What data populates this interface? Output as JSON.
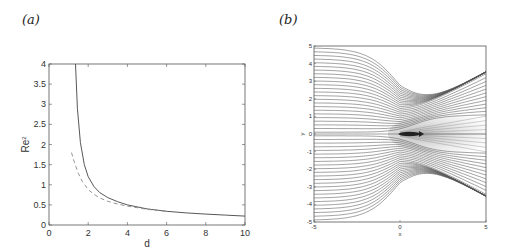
{
  "panels": {
    "a": {
      "label": "(a)"
    },
    "b": {
      "label": "(b)"
    }
  },
  "chart_data": [
    {
      "type": "line",
      "panel": "(a)",
      "title": "",
      "xlabel": "d",
      "ylabel": "Re^2",
      "xlim": [
        0,
        10
      ],
      "ylim": [
        0,
        4
      ],
      "xticks": [
        "0",
        "2",
        "4",
        "6",
        "8",
        "10"
      ],
      "yticks": [
        "0",
        "0.5",
        "1",
        "1.5",
        "2",
        "2.5",
        "3",
        "3.5",
        "4"
      ],
      "grid": false,
      "legend": null,
      "series": [
        {
          "name": "solid",
          "style": "solid",
          "x": [
            1.35,
            1.45,
            1.6,
            1.8,
            2.0,
            2.3,
            2.6,
            3.0,
            3.5,
            4.0,
            5.0,
            6.0,
            7.0,
            8.0,
            9.0,
            10.0
          ],
          "y": [
            4.0,
            2.9,
            2.05,
            1.5,
            1.2,
            0.95,
            0.8,
            0.68,
            0.58,
            0.5,
            0.4,
            0.34,
            0.3,
            0.27,
            0.245,
            0.22
          ]
        },
        {
          "name": "dashed",
          "style": "dashed",
          "x": [
            1.15,
            1.3,
            1.5,
            1.7,
            2.0,
            2.3,
            2.6,
            3.0,
            3.5,
            4.0,
            5.0,
            6.0
          ],
          "y": [
            1.8,
            1.55,
            1.28,
            1.08,
            0.88,
            0.76,
            0.67,
            0.59,
            0.52,
            0.47,
            0.39,
            0.34
          ]
        }
      ]
    },
    {
      "type": "line",
      "subtype": "streamlines",
      "panel": "(b)",
      "title": "",
      "xlabel": "x",
      "ylabel": "y",
      "xlim": [
        -5,
        5
      ],
      "ylim": [
        -5,
        5
      ],
      "xticks": [
        "-5",
        "0",
        "5"
      ],
      "yticks": [
        "-5",
        "-4",
        "-3",
        "-2",
        "-1",
        "0",
        "1",
        "2",
        "3",
        "4",
        "5"
      ],
      "grid": false,
      "annotations": [
        "dark wake region along y=0 for x>0",
        "arrow near origin pointing +x"
      ],
      "description": "Streamlines converge toward origin from left, then bend away forming a wake between y=-1 and y=1 downstream"
    }
  ]
}
